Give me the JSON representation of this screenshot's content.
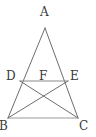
{
  "figure": {
    "kind": "geometry-diagram",
    "shape": "isosceles-triangle-with-cevians",
    "width": 96,
    "height": 137,
    "background_color": "#ffffff",
    "line_color": "#6e6e6e",
    "base_line_color": "#9a9a9a",
    "label_color": "#3a3a3a",
    "stroke_width": 1
  },
  "points": {
    "A": {
      "label": "A",
      "x": 45,
      "y": 28,
      "label_x": 40,
      "label_y": 6
    },
    "B": {
      "label": "B",
      "x": 8,
      "y": 118,
      "label_x": -1,
      "label_y": 120
    },
    "C": {
      "label": "C",
      "x": 78,
      "y": 118,
      "label_x": 79,
      "label_y": 120
    },
    "D": {
      "label": "D",
      "x": 20,
      "y": 81,
      "label_x": 6,
      "label_y": 70
    },
    "E": {
      "label": "E",
      "x": 68,
      "y": 81,
      "label_x": 70,
      "label_y": 70
    },
    "F": {
      "label": "F",
      "x": 45,
      "y": 91,
      "label_x": 39,
      "label_y": 70
    }
  },
  "segments": [
    {
      "name": "side-AB",
      "from": "A",
      "to": "B"
    },
    {
      "name": "side-AC",
      "from": "A",
      "to": "C"
    },
    {
      "name": "base-BC",
      "from": "B",
      "to": "C"
    },
    {
      "name": "cevian-DC",
      "from": "D",
      "to": "C"
    },
    {
      "name": "cevian-EB",
      "from": "E",
      "to": "B"
    },
    {
      "name": "segment-DE",
      "from": "D",
      "to": "E"
    }
  ],
  "labels": {
    "A": "A",
    "B": "B",
    "C": "C",
    "D": "D",
    "E": "E",
    "F": "F"
  }
}
